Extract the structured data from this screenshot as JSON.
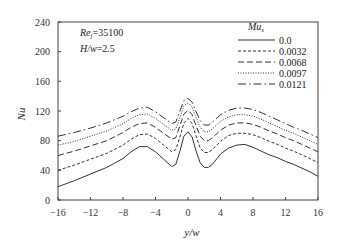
{
  "chart_data": {
    "type": "line",
    "title": "",
    "xlabel": "y/w",
    "ylabel": "Nu",
    "xlim": [
      -16,
      16
    ],
    "ylim": [
      0,
      240
    ],
    "xticks": [
      -16,
      -12,
      -8,
      -4,
      0,
      4,
      8,
      12,
      16
    ],
    "yticks": [
      0,
      40,
      80,
      120,
      160,
      200,
      240
    ],
    "xtick_labels": [
      "-16",
      "-12",
      "-8",
      "-4",
      "0",
      "4",
      "8",
      "12",
      "16"
    ],
    "ytick_labels": [
      "0",
      "40",
      "80",
      "120",
      "160",
      "200",
      "240"
    ],
    "grid": false,
    "annotations": [
      {
        "text": "Re",
        "sub": "j",
        "value": "=35100"
      },
      {
        "text": "H/w",
        "sub": "",
        "value": "=2.5"
      }
    ],
    "legend": {
      "title": "Mu",
      "title_sub": "s",
      "position": "upper right",
      "entries": [
        "0.0",
        "0.0032",
        "0.0068",
        "0.0097",
        "0.0121"
      ]
    },
    "x": [
      -16,
      -14,
      -12,
      -10,
      -8,
      -7,
      -6,
      -5,
      -4,
      -3,
      -2,
      -1.5,
      -1,
      -0.5,
      0,
      0.5,
      1,
      1.5,
      2,
      2.5,
      3,
      4,
      5,
      6,
      7,
      8,
      9,
      10,
      11,
      12,
      13,
      14,
      15,
      16
    ],
    "series": [
      {
        "name": "0.0",
        "style": "solid",
        "values": [
          18,
          26,
          35,
          44,
          56,
          65,
          72,
          72,
          65,
          55,
          45,
          48,
          66,
          86,
          92,
          85,
          66,
          50,
          44,
          44,
          48,
          62,
          70,
          74,
          75,
          71,
          66,
          61,
          57,
          52,
          48,
          43,
          38,
          32
        ]
      },
      {
        "name": "0.0032",
        "style": "dashed-short",
        "values": [
          40,
          47,
          55,
          63,
          74,
          82,
          88,
          89,
          83,
          74,
          65,
          68,
          85,
          104,
          110,
          103,
          86,
          70,
          64,
          64,
          68,
          79,
          87,
          90,
          90,
          88,
          84,
          79,
          75,
          70,
          66,
          61,
          56,
          50
        ]
      },
      {
        "name": "0.0068",
        "style": "dashed-long",
        "values": [
          60,
          66,
          73,
          80,
          91,
          98,
          103,
          104,
          98,
          90,
          82,
          84,
          100,
          116,
          121,
          115,
          100,
          86,
          80,
          80,
          84,
          94,
          101,
          104,
          104,
          102,
          98,
          93,
          89,
          84,
          80,
          75,
          70,
          65
        ]
      },
      {
        "name": "0.0097",
        "style": "dotted",
        "values": [
          74,
          79,
          86,
          93,
          103,
          110,
          115,
          116,
          110,
          102,
          94,
          96,
          111,
          127,
          131,
          125,
          111,
          98,
          92,
          92,
          96,
          106,
          112,
          115,
          115,
          113,
          109,
          104,
          99,
          94,
          90,
          85,
          80,
          75
        ]
      },
      {
        "name": "0.0121",
        "style": "dash-dot",
        "values": [
          86,
          91,
          97,
          104,
          113,
          119,
          124,
          125,
          119,
          111,
          103,
          105,
          120,
          134,
          137,
          132,
          119,
          107,
          101,
          101,
          105,
          115,
          121,
          124,
          124,
          122,
          118,
          113,
          108,
          103,
          98,
          94,
          89,
          84
        ]
      }
    ]
  }
}
